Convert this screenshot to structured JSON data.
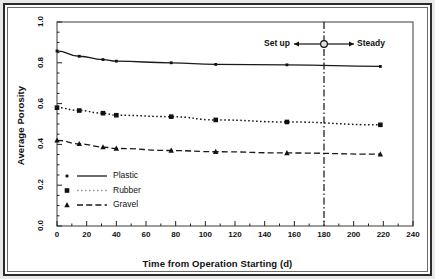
{
  "chart_data": {
    "type": "line",
    "title": "",
    "xlabel": "Time from Operation Starting (d)",
    "ylabel": "Average Porosity",
    "xlim": [
      0,
      240
    ],
    "ylim": [
      0.0,
      1.0
    ],
    "xticks": [
      0,
      20,
      40,
      60,
      80,
      100,
      120,
      140,
      160,
      180,
      200,
      220,
      240
    ],
    "xtick_labels": [
      "0",
      "20",
      "40",
      "60",
      "80",
      "100",
      "120",
      "140",
      "160",
      "180",
      "200",
      "220",
      "240"
    ],
    "yticks": [
      0.0,
      0.2,
      0.4,
      0.6,
      0.8,
      1.0
    ],
    "ytick_labels": [
      "0.0",
      "0.2",
      "0.4",
      "0.6",
      "0.8",
      "1.0"
    ],
    "xminor_step": 10,
    "yminor_step": 0.05,
    "grid": false,
    "legend_position": "lower-left",
    "series": [
      {
        "name": "Plastic",
        "marker": "dot",
        "linestyle": "solid",
        "color": "#1a1a1a",
        "x": [
          0,
          15,
          31,
          40,
          77,
          107,
          155,
          218
        ],
        "values": [
          0.858,
          0.832,
          0.816,
          0.808,
          0.8,
          0.792,
          0.79,
          0.782
        ]
      },
      {
        "name": "Rubber",
        "marker": "square",
        "linestyle": "dotted",
        "color": "#1a1a1a",
        "x": [
          0,
          15,
          31,
          40,
          77,
          107,
          155,
          218
        ],
        "values": [
          0.58,
          0.566,
          0.553,
          0.543,
          0.536,
          0.52,
          0.51,
          0.496
        ]
      },
      {
        "name": "Gravel",
        "marker": "triangle",
        "linestyle": "dashed",
        "color": "#1a1a1a",
        "x": [
          0,
          15,
          31,
          40,
          77,
          107,
          155,
          218
        ],
        "values": [
          0.42,
          0.403,
          0.387,
          0.38,
          0.37,
          0.364,
          0.358,
          0.352
        ]
      }
    ],
    "annotations": [
      {
        "name": "phase-divider",
        "type": "vline",
        "x": 180,
        "linestyle": "dashdot",
        "label_left": "Set up",
        "label_right": "Steady",
        "marker": "circle"
      }
    ]
  },
  "legend": {
    "items": [
      {
        "label": "Plastic"
      },
      {
        "label": "Rubber"
      },
      {
        "label": "Gravel"
      }
    ]
  },
  "annotation": {
    "setup_label": "Set up",
    "steady_label": "Steady"
  },
  "axes": {
    "x_title": "Time from Operation Starting (d)",
    "y_title": "Average Porosity"
  }
}
